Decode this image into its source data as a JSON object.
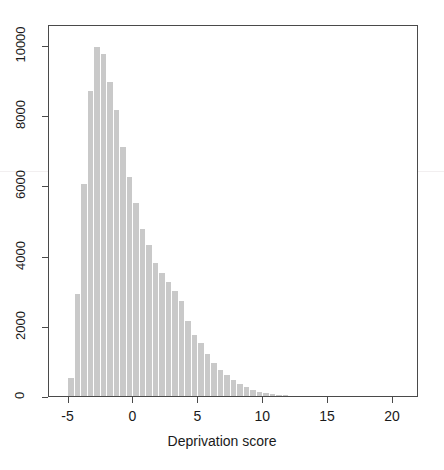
{
  "chart_data": {
    "type": "bar",
    "title": "",
    "subtitle": "",
    "xlabel": "Deprivation score",
    "ylabel": "",
    "xlim": [
      -6.5,
      22.0
    ],
    "ylim": [
      0,
      10600
    ],
    "grid": false,
    "legend": null,
    "bin_width": 0.5,
    "xticks": [
      -5,
      0,
      5,
      10,
      15,
      20
    ],
    "xtick_labels": [
      "-5",
      "0",
      "5",
      "10",
      "15",
      "20"
    ],
    "yticks": [
      0,
      2000,
      4000,
      6000,
      8000,
      10000
    ],
    "ytick_labels": [
      "0",
      "2000",
      "4000",
      "6000",
      "8000",
      "10000"
    ],
    "bar_color": "#c9c9c9",
    "axis_color": "#4a4a4a",
    "text_color": "#1a1a1a",
    "x": [
      -4.75,
      -4.25,
      -3.75,
      -3.25,
      -2.75,
      -2.25,
      -1.75,
      -1.25,
      -0.75,
      -0.25,
      0.25,
      0.75,
      1.25,
      1.75,
      2.25,
      2.75,
      3.25,
      3.75,
      4.25,
      4.75,
      5.25,
      5.75,
      6.25,
      6.75,
      7.25,
      7.75,
      8.25,
      8.75,
      9.25,
      9.75,
      10.25,
      10.75,
      11.25,
      11.75
    ],
    "categories": [
      "-4.75",
      "-4.25",
      "-3.75",
      "-3.25",
      "-2.75",
      "-2.25",
      "-1.75",
      "-1.25",
      "-0.75",
      "-0.25",
      "0.25",
      "0.75",
      "1.25",
      "1.75",
      "2.25",
      "2.75",
      "3.25",
      "3.75",
      "4.25",
      "4.75",
      "5.25",
      "5.75",
      "6.25",
      "6.75",
      "7.25",
      "7.75",
      "8.25",
      "8.75",
      "9.25",
      "9.75",
      "10.25",
      "10.75",
      "11.25",
      "11.75"
    ],
    "values": [
      500,
      2900,
      6050,
      8700,
      9950,
      9750,
      8950,
      8150,
      7100,
      6250,
      5500,
      4750,
      4300,
      3800,
      3500,
      3250,
      3000,
      2700,
      2150,
      1750,
      1500,
      1200,
      950,
      750,
      600,
      450,
      350,
      250,
      170,
      120,
      80,
      55,
      35,
      20
    ]
  },
  "axis": {
    "xlabel": "Deprivation score"
  }
}
